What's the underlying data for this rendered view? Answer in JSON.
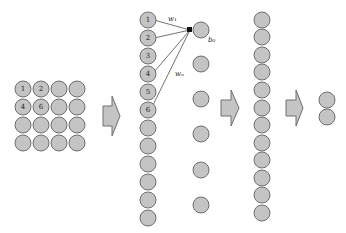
{
  "diagram": {
    "type": "neural-network-flattening",
    "input_grid": {
      "rows": 4,
      "cols": 4,
      "labels": {
        "0": "1",
        "1": "2",
        "4": "4",
        "5": "6"
      }
    },
    "flattened_column": {
      "count": 16,
      "labels": [
        "1",
        "2",
        "3",
        "4",
        "5",
        "6"
      ]
    },
    "hidden_layer": {
      "count": 6,
      "bias_label": "b₀"
    },
    "weights": {
      "w1_label": "w₁",
      "wn_label": "wₙ"
    },
    "second_layer": {
      "count": 12
    },
    "output_layer": {
      "count": 2
    },
    "colors": {
      "node_fill": "#c4c4c4",
      "node_stroke": "#6f6f6f",
      "edge": "#333333"
    }
  }
}
